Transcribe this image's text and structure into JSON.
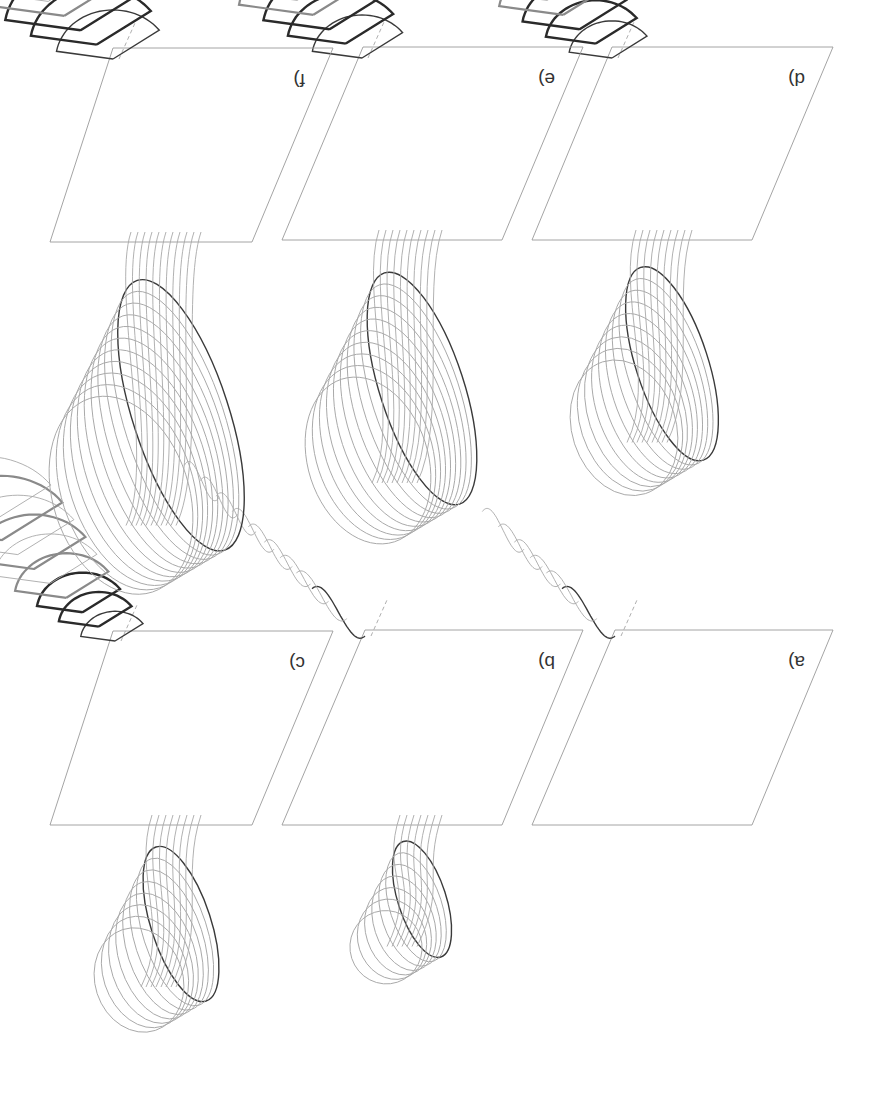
{
  "figure": {
    "orientation": "rotated-180",
    "background": "#ffffff",
    "colors": {
      "plane": "#9a9a9a",
      "curve_light": "#a8a8a8",
      "curve_mid": "#8a8a8a",
      "curve_dark": "#3a3a3a"
    },
    "panels": [
      {
        "id": "a",
        "label": "a)",
        "row": "bottom",
        "col": "right",
        "plane": [
          [
            615,
            630
          ],
          [
            833,
            630
          ],
          [
            752,
            825
          ],
          [
            532,
            825
          ]
        ],
        "apex": [
          615,
          640
        ],
        "shape": "leaf",
        "count": 6,
        "size": 1.0,
        "lobe": 0
      },
      {
        "id": "b",
        "label": "b)",
        "row": "bottom",
        "col": "middle",
        "plane": [
          [
            365,
            630
          ],
          [
            583,
            630
          ],
          [
            502,
            825
          ],
          [
            282,
            825
          ]
        ],
        "apex": [
          365,
          640
        ],
        "shape": "leaf",
        "count": 9,
        "size": 1.1,
        "lobe": 1
      },
      {
        "id": "c",
        "label": "c)",
        "row": "bottom",
        "col": "left",
        "plane": [
          [
            113,
            631
          ],
          [
            333,
            631
          ],
          [
            252,
            825
          ],
          [
            50,
            825
          ]
        ],
        "apex": [
          115,
          645
        ],
        "shape": "fan",
        "count": 9,
        "size": 1.0,
        "lobe": 2
      },
      {
        "id": "d",
        "label": "d)",
        "row": "top",
        "col": "right",
        "plane": [
          [
            612,
            47
          ],
          [
            833,
            47
          ],
          [
            752,
            240
          ],
          [
            532,
            240
          ]
        ],
        "apex": [
          612,
          62
        ],
        "shape": "fan",
        "count": 10,
        "size": 1.25,
        "lobe": 3
      },
      {
        "id": "e",
        "label": "e)",
        "row": "top",
        "col": "middle",
        "plane": [
          [
            363,
            47
          ],
          [
            583,
            47
          ],
          [
            502,
            240
          ],
          [
            282,
            240
          ]
        ],
        "apex": [
          362,
          62
        ],
        "shape": "fan",
        "count": 11,
        "size": 1.45,
        "lobe": 4
      },
      {
        "id": "f",
        "label": "f)",
        "row": "top",
        "col": "left",
        "plane": [
          [
            113,
            48
          ],
          [
            333,
            48
          ],
          [
            252,
            242
          ],
          [
            50,
            242
          ]
        ],
        "apex": [
          113,
          63
        ],
        "shape": "fan",
        "count": 12,
        "size": 1.65,
        "lobe": 5
      }
    ]
  }
}
